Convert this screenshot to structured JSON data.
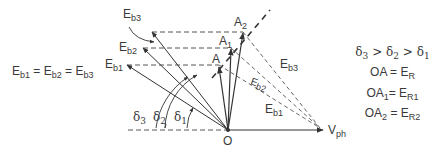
{
  "diagram": {
    "origin_label": "O",
    "reference_label": {
      "main": "V",
      "sub": "ph"
    },
    "vectors": [
      {
        "name": "Eb1",
        "main": "E",
        "sub": "b1"
      },
      {
        "name": "Eb2",
        "main": "E",
        "sub": "b2"
      },
      {
        "name": "Eb3",
        "main": "E",
        "sub": "b3"
      }
    ],
    "points": [
      {
        "main": "A",
        "sub": ""
      },
      {
        "main": "A",
        "sub": "1"
      },
      {
        "main": "A",
        "sub": "2"
      }
    ],
    "angles": [
      {
        "main": "δ",
        "sub": "1"
      },
      {
        "main": "δ",
        "sub": "2"
      },
      {
        "main": "δ",
        "sub": "3"
      }
    ],
    "dashed_labels": [
      {
        "main": "E",
        "sub": "b1"
      },
      {
        "main": "E",
        "sub": "b2"
      },
      {
        "main": "E",
        "sub": "b3"
      }
    ],
    "left_equation": {
      "parts": [
        {
          "main": "E",
          "sub": "b1"
        },
        {
          "main": " = E",
          "sub": "b2"
        },
        {
          "main": " = E",
          "sub": "b3"
        }
      ]
    },
    "right_notes": [
      {
        "parts": [
          {
            "main": "δ",
            "sub": "3"
          },
          {
            "main": " > δ",
            "sub": "2"
          },
          {
            "main": " > δ",
            "sub": "1"
          }
        ]
      },
      {
        "parts": [
          {
            "main": "OA = E",
            "sub": "R"
          }
        ]
      },
      {
        "parts": [
          {
            "main": "OA",
            "sub": "1"
          },
          {
            "main": "= E",
            "sub": "R1"
          }
        ]
      },
      {
        "parts": [
          {
            "main": "OA",
            "sub": "2"
          },
          {
            "main": " = E",
            "sub": "R2"
          }
        ]
      }
    ],
    "colors": {
      "line": "#333333",
      "dash": "#555555"
    }
  }
}
